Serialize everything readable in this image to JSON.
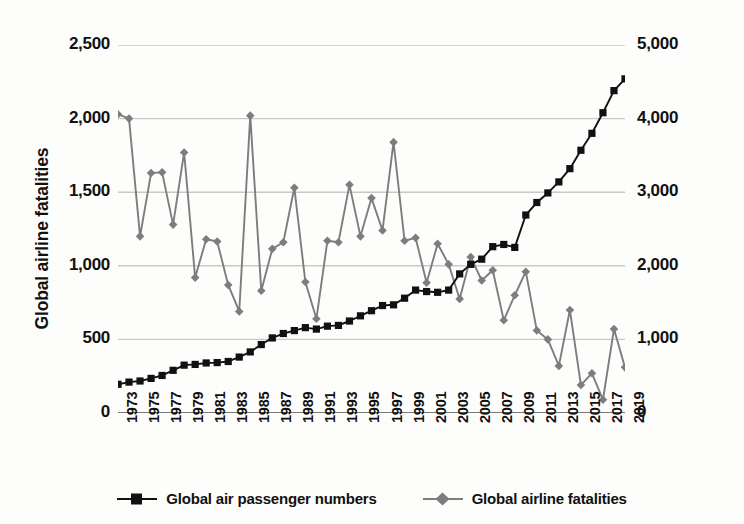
{
  "chart_data": {
    "type": "line",
    "title": "",
    "xlabel": "",
    "ylabel": "Global airline fatalities",
    "y2label": "Global air passenger numbers (in millions)",
    "grid": true,
    "legend_position": "bottom",
    "ylim": [
      0,
      2500
    ],
    "y2lim": [
      0,
      5000
    ],
    "xlim": [
      1973,
      2019
    ],
    "y_ticks": [
      "0",
      "500",
      "1,000",
      "1,500",
      "2,000",
      "2,500"
    ],
    "y_tick_values": [
      0,
      500,
      1000,
      1500,
      2000,
      2500
    ],
    "y2_ticks": [
      "0",
      "1,000",
      "2,000",
      "3,000",
      "4,000",
      "5,000"
    ],
    "y2_tick_values": [
      0,
      1000,
      2000,
      3000,
      4000,
      5000
    ],
    "x": [
      1973,
      1974,
      1975,
      1976,
      1977,
      1978,
      1979,
      1980,
      1981,
      1982,
      1983,
      1984,
      1985,
      1986,
      1987,
      1988,
      1989,
      1990,
      1991,
      1992,
      1993,
      1994,
      1995,
      1996,
      1997,
      1998,
      1999,
      2000,
      2001,
      2002,
      2003,
      2004,
      2005,
      2006,
      2007,
      2008,
      2009,
      2010,
      2011,
      2012,
      2013,
      2014,
      2015,
      2016,
      2017,
      2018,
      2019
    ],
    "x_tick_labels": [
      "1973",
      "1975",
      "1977",
      "1979",
      "1981",
      "1983",
      "1985",
      "1987",
      "1989",
      "1991",
      "1993",
      "1995",
      "1997",
      "1999",
      "2001",
      "2003",
      "2005",
      "2007",
      "2009",
      "2011",
      "2013",
      "2015",
      "2017",
      "2019"
    ],
    "x_tick_step": 2,
    "series": [
      {
        "name": "Global air passenger numbers",
        "axis": "right",
        "color": "#111111",
        "marker": "square",
        "unit": "millions",
        "values": [
          390,
          420,
          435,
          470,
          510,
          580,
          650,
          660,
          680,
          685,
          700,
          760,
          830,
          930,
          1020,
          1080,
          1120,
          1160,
          1140,
          1180,
          1190,
          1250,
          1320,
          1390,
          1460,
          1470,
          1560,
          1670,
          1650,
          1640,
          1670,
          1890,
          2020,
          2090,
          2260,
          2290,
          2250,
          2690,
          2860,
          2990,
          3140,
          3320,
          3570,
          3800,
          4080,
          4380,
          4540
        ]
      },
      {
        "name": "Global airline fatalities",
        "axis": "left",
        "color": "#7d7d7d",
        "marker": "diamond",
        "unit": "fatalities",
        "values": [
          2030,
          2000,
          1200,
          1630,
          1635,
          1280,
          1770,
          920,
          1180,
          1165,
          870,
          690,
          2020,
          830,
          1115,
          1160,
          1530,
          890,
          640,
          1170,
          1160,
          1550,
          1200,
          1460,
          1240,
          1840,
          1170,
          1190,
          885,
          1150,
          1010,
          775,
          1060,
          900,
          970,
          630,
          800,
          960,
          560,
          500,
          320,
          700,
          190,
          270,
          90,
          570,
          310
        ]
      }
    ]
  },
  "legend": {
    "items": [
      {
        "label": "Global air passenger numbers",
        "marker": "square-marker",
        "color": "#111111"
      },
      {
        "label": "Global airline fatalities",
        "marker": "diamond-marker",
        "color": "#7d7d7d"
      }
    ]
  },
  "colors": {
    "passenger_series": "#111111",
    "fatalities_series": "#7d7d7d",
    "gridline": "#c9c9c7",
    "axis": "#5a5a58",
    "background": "#fdfdfc"
  }
}
